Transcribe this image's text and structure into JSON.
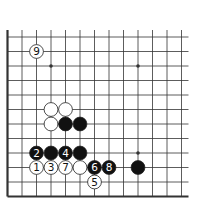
{
  "diagram": {
    "type": "go-board-fragment",
    "edges": [
      "left",
      "bottom"
    ],
    "columns": 13,
    "rows": 12,
    "star_points": [
      [
        3,
        2
      ],
      [
        9,
        2
      ],
      [
        9,
        8
      ]
    ],
    "stones": [
      {
        "col": 2,
        "row": 1,
        "color": "white",
        "label": "9"
      },
      {
        "col": 3,
        "row": 5,
        "color": "white",
        "label": ""
      },
      {
        "col": 4,
        "row": 5,
        "color": "white",
        "label": ""
      },
      {
        "col": 3,
        "row": 6,
        "color": "white",
        "label": ""
      },
      {
        "col": 4,
        "row": 6,
        "color": "black",
        "label": ""
      },
      {
        "col": 5,
        "row": 6,
        "color": "black",
        "label": ""
      },
      {
        "col": 2,
        "row": 8,
        "color": "black",
        "label": "2"
      },
      {
        "col": 3,
        "row": 8,
        "color": "black",
        "label": ""
      },
      {
        "col": 4,
        "row": 8,
        "color": "black",
        "label": "4"
      },
      {
        "col": 5,
        "row": 8,
        "color": "black",
        "label": ""
      },
      {
        "col": 2,
        "row": 9,
        "color": "white",
        "label": "1"
      },
      {
        "col": 3,
        "row": 9,
        "color": "white",
        "label": "3"
      },
      {
        "col": 4,
        "row": 9,
        "color": "white",
        "label": "7"
      },
      {
        "col": 5,
        "row": 9,
        "color": "white",
        "label": ""
      },
      {
        "col": 6,
        "row": 9,
        "color": "black",
        "label": "6"
      },
      {
        "col": 7,
        "row": 9,
        "color": "black",
        "label": "8"
      },
      {
        "col": 9,
        "row": 9,
        "color": "black",
        "label": ""
      },
      {
        "col": 6,
        "row": 10,
        "color": "white",
        "label": "5"
      }
    ],
    "colors": {
      "line": "#333333",
      "black_stone": "#111111",
      "white_stone": "#ffffff"
    }
  }
}
